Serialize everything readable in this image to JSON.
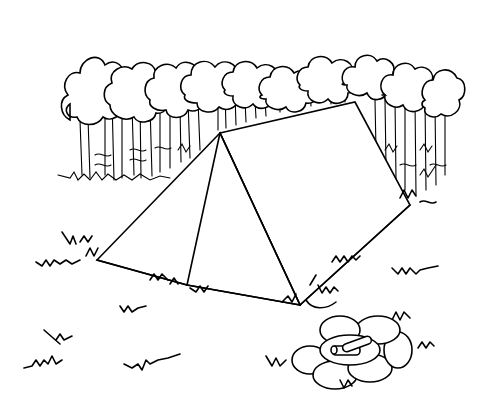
{
  "image": {
    "subject": "Line-art coloring page of a pup tent in a forest clearing with a stone fire pit",
    "ink_color": "#000000",
    "background_color": "#ffffff"
  },
  "scene": {
    "background": "row of deciduous trees with cloud-like canopies and thin trunks",
    "main_object": "triangular pup tent",
    "foreground": "grass tufts and a ring of stones with logs"
  }
}
